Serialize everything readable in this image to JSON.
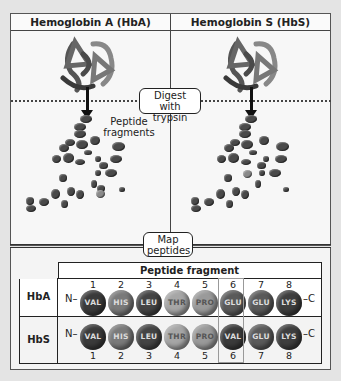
{
  "panels": {
    "left_title": "Hemoglobin A (HbA)",
    "right_title": "Hemoglobin S (HbS)"
  },
  "steps": {
    "digest": [
      "Digest with",
      "trypsin"
    ],
    "map": [
      "Map",
      "peptides"
    ]
  },
  "fragments_label": [
    "Peptide",
    "fragments"
  ],
  "table": {
    "header": "Peptide fragment",
    "rows": [
      {
        "label": "HbA",
        "n_term": "N–",
        "c_term": "–C",
        "positions": [
          "1",
          "2",
          "3",
          "4",
          "5",
          "6",
          "7",
          "8"
        ],
        "residues": [
          "VAL",
          "HIS",
          "LEU",
          "THR",
          "PRO",
          "GLU",
          "GLU",
          "LYS"
        ]
      },
      {
        "label": "HbS",
        "n_term": "N–",
        "c_term": "–C",
        "positions": [
          "1",
          "2",
          "3",
          "4",
          "5",
          "6",
          "7",
          "8"
        ],
        "residues": [
          "VAL",
          "HIS",
          "LEU",
          "THR",
          "PRO",
          "VAL",
          "GLU",
          "LYS"
        ]
      }
    ],
    "highlighted_position": "6"
  },
  "colors": {
    "VAL": "#3a3a3a",
    "HIS": "#7a7a7a",
    "LEU": "#444444",
    "THR": "#a6a6a6",
    "PRO": "#9a9a9a",
    "GLU": "#5a5a5a",
    "LYS": "#3e3e3e"
  }
}
